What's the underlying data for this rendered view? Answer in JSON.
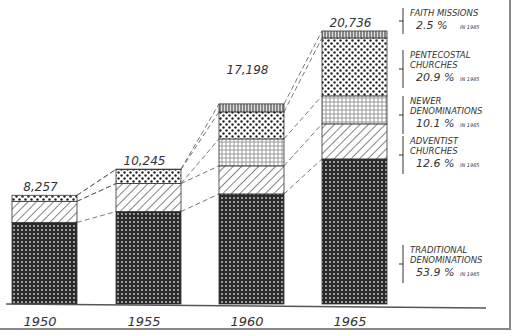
{
  "chart_data": {
    "type": "bar",
    "stacked": true,
    "title": "",
    "xlabel": "",
    "ylabel": "",
    "categories": [
      "1950",
      "1955",
      "1960",
      "1965"
    ],
    "totals": [
      8257,
      10245,
      17198,
      20736
    ],
    "total_labels": [
      "8,257",
      "10,245",
      "17,198",
      "20,736"
    ],
    "series": [
      {
        "name": "Traditional Denominations",
        "pattern": "dense-dots",
        "values": [
          6200,
          7020,
          8360,
          11020
        ]
      },
      {
        "name": "Adventist Churches",
        "pattern": "diagonal-hatch",
        "values": [
          1600,
          2130,
          2130,
          2660
        ]
      },
      {
        "name": "Newer Denominations",
        "pattern": "small-circles",
        "values": [
          0,
          0,
          2050,
          2130
        ]
      },
      {
        "name": "Pentecostal Churches",
        "pattern": "large-dots",
        "values": [
          457,
          1065,
          2050,
          4400
        ]
      },
      {
        "name": "Faith Missions",
        "pattern": "vertical-lines",
        "values": [
          0,
          30,
          608,
          526
        ]
      }
    ],
    "legend": [
      {
        "line1": "FAITH MISSIONS",
        "line2": "",
        "pct": "2.5 %",
        "note": "IN 1965"
      },
      {
        "line1": "PENTECOSTAL",
        "line2": "CHURCHES",
        "pct": "20.9 %",
        "note": "IN 1965"
      },
      {
        "line1": "NEWER",
        "line2": "DENOMINATIONS",
        "pct": "10.1 %",
        "note": "IN 1965"
      },
      {
        "line1": "ADVENTIST",
        "line2": "CHURCHES",
        "pct": "12.6 %",
        "note": "IN 1965"
      },
      {
        "line1": "TRADITIONAL",
        "line2": "DENOMINATIONS",
        "pct": "53.9 %",
        "note": "IN 1965"
      }
    ],
    "legend_position": "right",
    "grid": false,
    "connector_lines": "dashed lines link segment boundaries between adjacent bars"
  }
}
